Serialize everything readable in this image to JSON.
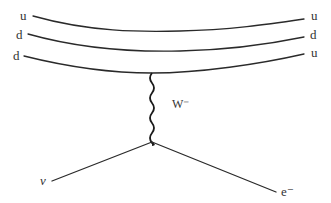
{
  "diagram": {
    "type": "feynman",
    "incoming_quarks": [
      {
        "label": "u"
      },
      {
        "label": "d"
      },
      {
        "label": "d"
      }
    ],
    "outgoing_quarks": [
      {
        "label": "u"
      },
      {
        "label": "d"
      },
      {
        "label": "u"
      }
    ],
    "boson": {
      "label": "W⁻"
    },
    "leptons": {
      "left": {
        "label": "ν"
      },
      "right": {
        "label": "e⁻"
      }
    }
  }
}
